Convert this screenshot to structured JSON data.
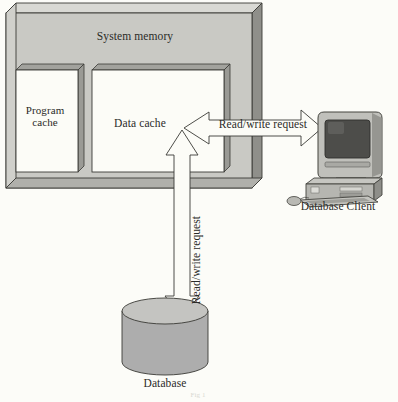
{
  "diagram": {
    "title_label": "System memory",
    "blocks": {
      "program_cache": "Program\ncache",
      "data_cache": "Data cache"
    },
    "arrows": {
      "horizontal_label": "Read/write request",
      "vertical_label": "Read/write request"
    },
    "nodes": {
      "client_label": "Database Client",
      "database_label": "Database"
    },
    "caption_fragment": "Fig 1",
    "colors": {
      "page_background": "#fcfcf8",
      "slab_face": "#c8c8c3",
      "slab_top_bevel": "#d6d6d1",
      "slab_side_bevel": "#8f8f8a",
      "inner_box_fill": "#fcfcf7",
      "inner_box_shadow": "#9a9a95",
      "arrow_fill": "#fcfcf7",
      "cylinder_fill": "#adadad",
      "cylinder_top": "#c3c3c0",
      "outline": "#3a3a36",
      "text": "#2b2b28",
      "monitor_bezel": "#b9b9b4",
      "monitor_screen": "#4a4a47",
      "case_body": "#b4b4af",
      "keyboard": "#c0c0bb"
    }
  }
}
